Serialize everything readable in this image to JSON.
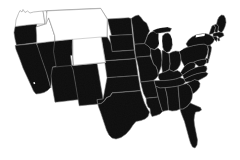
{
  "figure": {
    "background_color": "#ffffff",
    "width": 240,
    "height": 160
  },
  "map_data": {
    "type": "choropleth",
    "region": "United States (contiguous / lower 48)",
    "projection": "albers-usa",
    "legend_position": "none",
    "grid": false,
    "fill_colors": {
      "filled": "#0d0d0d",
      "unfilled": "#ffffff",
      "boundary_filled": "#6e6e6e",
      "boundary_unfilled": "#8a8a8a",
      "background": "#ffffff"
    },
    "categories": [
      "filled",
      "unfilled"
    ],
    "counts": {
      "filled": 44,
      "unfilled": 4
    },
    "unfilled_states": [
      "Washington",
      "Idaho",
      "Montana",
      "Wyoming"
    ],
    "states": [
      {
        "code": "WA",
        "name": "Washington",
        "value": 0,
        "status": "unfilled"
      },
      {
        "code": "ID",
        "name": "Idaho",
        "value": 0,
        "status": "unfilled"
      },
      {
        "code": "MT",
        "name": "Montana",
        "value": 0,
        "status": "unfilled"
      },
      {
        "code": "WY",
        "name": "Wyoming",
        "value": 0,
        "status": "unfilled"
      },
      {
        "code": "OR",
        "name": "Oregon",
        "value": 1,
        "status": "filled"
      },
      {
        "code": "CA",
        "name": "California",
        "value": 1,
        "status": "filled"
      },
      {
        "code": "NV",
        "name": "Nevada",
        "value": 1,
        "status": "filled"
      },
      {
        "code": "UT",
        "name": "Utah",
        "value": 1,
        "status": "filled"
      },
      {
        "code": "AZ",
        "name": "Arizona",
        "value": 1,
        "status": "filled"
      },
      {
        "code": "CO",
        "name": "Colorado",
        "value": 1,
        "status": "filled"
      },
      {
        "code": "NM",
        "name": "New Mexico",
        "value": 1,
        "status": "filled"
      },
      {
        "code": "ND",
        "name": "North Dakota",
        "value": 1,
        "status": "filled"
      },
      {
        "code": "SD",
        "name": "South Dakota",
        "value": 1,
        "status": "filled"
      },
      {
        "code": "NE",
        "name": "Nebraska",
        "value": 1,
        "status": "filled"
      },
      {
        "code": "KS",
        "name": "Kansas",
        "value": 1,
        "status": "filled"
      },
      {
        "code": "OK",
        "name": "Oklahoma",
        "value": 1,
        "status": "filled"
      },
      {
        "code": "TX",
        "name": "Texas",
        "value": 1,
        "status": "filled"
      },
      {
        "code": "MN",
        "name": "Minnesota",
        "value": 1,
        "status": "filled"
      },
      {
        "code": "IA",
        "name": "Iowa",
        "value": 1,
        "status": "filled"
      },
      {
        "code": "MO",
        "name": "Missouri",
        "value": 1,
        "status": "filled"
      },
      {
        "code": "AR",
        "name": "Arkansas",
        "value": 1,
        "status": "filled"
      },
      {
        "code": "LA",
        "name": "Louisiana",
        "value": 1,
        "status": "filled"
      },
      {
        "code": "WI",
        "name": "Wisconsin",
        "value": 1,
        "status": "filled"
      },
      {
        "code": "IL",
        "name": "Illinois",
        "value": 1,
        "status": "filled"
      },
      {
        "code": "MI",
        "name": "Michigan",
        "value": 1,
        "status": "filled"
      },
      {
        "code": "IN",
        "name": "Indiana",
        "value": 1,
        "status": "filled"
      },
      {
        "code": "OH",
        "name": "Ohio",
        "value": 1,
        "status": "filled"
      },
      {
        "code": "KY",
        "name": "Kentucky",
        "value": 1,
        "status": "filled"
      },
      {
        "code": "TN",
        "name": "Tennessee",
        "value": 1,
        "status": "filled"
      },
      {
        "code": "MS",
        "name": "Mississippi",
        "value": 1,
        "status": "filled"
      },
      {
        "code": "AL",
        "name": "Alabama",
        "value": 1,
        "status": "filled"
      },
      {
        "code": "GA",
        "name": "Georgia",
        "value": 1,
        "status": "filled"
      },
      {
        "code": "FL",
        "name": "Florida",
        "value": 1,
        "status": "filled"
      },
      {
        "code": "SC",
        "name": "South Carolina",
        "value": 1,
        "status": "filled"
      },
      {
        "code": "NC",
        "name": "North Carolina",
        "value": 1,
        "status": "filled"
      },
      {
        "code": "VA",
        "name": "Virginia",
        "value": 1,
        "status": "filled"
      },
      {
        "code": "WV",
        "name": "West Virginia",
        "value": 1,
        "status": "filled"
      },
      {
        "code": "MD",
        "name": "Maryland",
        "value": 1,
        "status": "filled"
      },
      {
        "code": "DE",
        "name": "Delaware",
        "value": 1,
        "status": "filled"
      },
      {
        "code": "PA",
        "name": "Pennsylvania",
        "value": 1,
        "status": "filled"
      },
      {
        "code": "NJ",
        "name": "New Jersey",
        "value": 1,
        "status": "filled"
      },
      {
        "code": "NY",
        "name": "New York",
        "value": 1,
        "status": "filled"
      },
      {
        "code": "CT",
        "name": "Connecticut",
        "value": 1,
        "status": "filled"
      },
      {
        "code": "RI",
        "name": "Rhode Island",
        "value": 1,
        "status": "filled"
      },
      {
        "code": "MA",
        "name": "Massachusetts",
        "value": 1,
        "status": "filled"
      },
      {
        "code": "VT",
        "name": "Vermont",
        "value": 1,
        "status": "filled"
      },
      {
        "code": "NH",
        "name": "New Hampshire",
        "value": 1,
        "status": "filled"
      },
      {
        "code": "ME",
        "name": "Maine",
        "value": 1,
        "status": "filled"
      }
    ]
  }
}
